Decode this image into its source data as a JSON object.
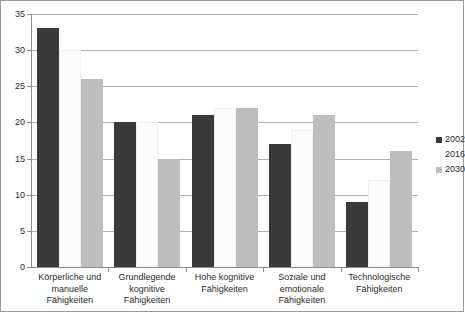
{
  "chart_data": {
    "type": "bar",
    "title": "",
    "subtitle": "",
    "xlabel": "",
    "ylabel": "",
    "ylim": [
      0,
      35
    ],
    "ytick_step": 5,
    "yticks": [
      "0",
      "5",
      "10",
      "15",
      "20",
      "25",
      "30",
      "35"
    ],
    "grid": true,
    "legend_position": "right",
    "categories": [
      "Körperliche und manuelle Fähigkeiten",
      "Grundlegende kognitive Fähigkeiten",
      "Hohe kognitive Fähigkeiten",
      "Soziale und emotionale Fähigkeiten",
      "Technologische Fähigkeiten"
    ],
    "category_lines": [
      [
        "Körperliche und",
        "manuelle",
        "Fähigkeiten"
      ],
      [
        "Grundlegende",
        "kognitive",
        "Fähigkeiten"
      ],
      [
        "Hohe kognitive",
        "Fähigkeiten"
      ],
      [
        "Soziale und",
        "emotionale",
        "Fähigkeiten"
      ],
      [
        "Technologische",
        "Fähigkeiten"
      ]
    ],
    "series": [
      {
        "name": "2002",
        "color": "#3a3a3a",
        "values": [
          33,
          20,
          21,
          17,
          9
        ]
      },
      {
        "name": "2016",
        "color": "#ffffff",
        "values": [
          30,
          20,
          22,
          19,
          12
        ]
      },
      {
        "name": "2030",
        "color": "#bdbdbd",
        "values": [
          26,
          15,
          22,
          21,
          16
        ]
      }
    ]
  },
  "legend": {
    "items": [
      {
        "label": "2002",
        "swatch": "legend-swatch-2002"
      },
      {
        "label": "2016",
        "swatch": "legend-swatch-2016"
      },
      {
        "label": "2030",
        "swatch": "legend-swatch-2030"
      }
    ]
  }
}
